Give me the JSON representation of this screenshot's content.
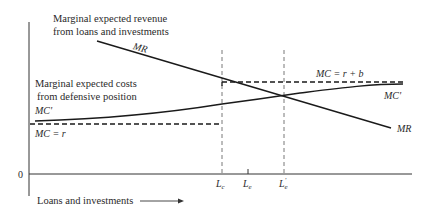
{
  "diagram": {
    "type": "economic-diagram",
    "title": "",
    "colors": {
      "line": "#1a1a1a",
      "axis": "#333333",
      "dashed": "#555555",
      "text": "#2a2a2a"
    },
    "axes": {
      "origin_label": "0",
      "x_label": "Loans and investments",
      "x_arrow": "→"
    },
    "annotations": {
      "revenue_line1": "Marginal expected revenue",
      "revenue_line2": "from loans and investments",
      "costs_line1": "Marginal expected costs",
      "costs_line2": "from defensive position"
    },
    "curves": {
      "mr_label_top": "MR",
      "mr_label_end": "MR",
      "mc_prime_label_left": "MC'",
      "mc_prime_label_right": "MC'",
      "mc_r_label": "MC = r",
      "mc_rb_label": "MC = r + b"
    },
    "ticks": {
      "lc": "L",
      "lc_sub": "c",
      "le": "L",
      "le_sub": "e",
      "le_prime": "L",
      "le_prime_sub": "e",
      "le_prime_mark": "'"
    }
  }
}
